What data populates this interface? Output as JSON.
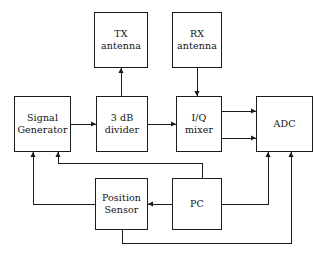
{
  "diagram": {
    "background_color": "#ffffff",
    "stroke_color": "#1a1a1a",
    "text_color": "#111111",
    "nodes": [
      {
        "id": "tx-antenna",
        "name": "tx-antenna-block",
        "line1": "TX",
        "line2": "antenna",
        "x": 94,
        "y": 12,
        "w": 54,
        "h": 56
      },
      {
        "id": "rx-antenna",
        "name": "rx-antenna-block",
        "line1": "RX",
        "line2": "antenna",
        "x": 172,
        "y": 12,
        "w": 50,
        "h": 56
      },
      {
        "id": "signal-generator",
        "name": "signal-generator-block",
        "line1": "Signal",
        "line2": "Generator",
        "x": 14,
        "y": 96,
        "w": 57,
        "h": 56
      },
      {
        "id": "divider",
        "name": "three-db-divider-block",
        "line1": "3 dB",
        "line2": "divider",
        "x": 96,
        "y": 96,
        "w": 52,
        "h": 56
      },
      {
        "id": "iq-mixer",
        "name": "iq-mixer-block",
        "line1": "I/Q",
        "line2": "mixer",
        "x": 176,
        "y": 96,
        "w": 46,
        "h": 56
      },
      {
        "id": "adc",
        "name": "adc-block",
        "line1": "ADC",
        "line2": "",
        "x": 256,
        "y": 96,
        "w": 57,
        "h": 56
      },
      {
        "id": "position-sensor",
        "name": "position-sensor-block",
        "line1": "Position",
        "line2": "Sensor",
        "x": 95,
        "y": 178,
        "w": 53,
        "h": 52
      },
      {
        "id": "pc",
        "name": "pc-block",
        "line1": "PC",
        "line2": "",
        "x": 172,
        "y": 178,
        "w": 50,
        "h": 52
      }
    ],
    "connections": [
      {
        "id": "divider-to-tx",
        "name": "wire-divider-to-tx-antenna",
        "from": "divider",
        "to": "tx-antenna",
        "points": "121,96 121,68",
        "arrow_at": "121,68",
        "arrow_dir": "up"
      },
      {
        "id": "rx-to-mixer",
        "name": "wire-rx-antenna-to-iq-mixer",
        "from": "rx-antenna",
        "to": "iq-mixer",
        "points": "197,68 197,96",
        "arrow_at": "197,96",
        "arrow_dir": "down"
      },
      {
        "id": "siggen-to-divider",
        "name": "wire-signal-generator-to-divider",
        "from": "signal-generator",
        "to": "divider",
        "points": "71,124 96,124",
        "arrow_at": "96,124",
        "arrow_dir": "right"
      },
      {
        "id": "divider-to-mixer",
        "name": "wire-divider-to-iq-mixer",
        "from": "divider",
        "to": "iq-mixer",
        "points": "148,124 176,124",
        "arrow_at": "176,124",
        "arrow_dir": "right"
      },
      {
        "id": "mixer-to-adc-i",
        "name": "wire-iq-mixer-to-adc-channel-i",
        "from": "iq-mixer",
        "to": "adc",
        "points": "222,111 256,111",
        "arrow_at": "256,111",
        "arrow_dir": "right"
      },
      {
        "id": "mixer-to-adc-q",
        "name": "wire-iq-mixer-to-adc-channel-q",
        "from": "iq-mixer",
        "to": "adc",
        "points": "222,138 256,138",
        "arrow_at": "256,138",
        "arrow_dir": "right"
      },
      {
        "id": "pc-to-siggen",
        "name": "wire-pc-to-signal-generator",
        "from": "pc",
        "to": "signal-generator",
        "points": "202,178 202,163 58,163 58,152",
        "arrow_at": "58,152",
        "arrow_dir": "up"
      },
      {
        "id": "pc-to-adc",
        "name": "wire-pc-to-adc",
        "from": "pc",
        "to": "adc",
        "points": "222,204 268,204 268,152",
        "arrow_at": "268,152",
        "arrow_dir": "up"
      },
      {
        "id": "pc-to-position-sensor",
        "name": "wire-pc-to-position-sensor",
        "from": "pc",
        "to": "position-sensor",
        "points": "172,204 148,204",
        "arrow_at": "148,204",
        "arrow_dir": "left"
      },
      {
        "id": "position-sensor-to-siggen",
        "name": "wire-position-sensor-to-signal-generator",
        "from": "position-sensor",
        "to": "signal-generator",
        "points": "95,204 33,204 33,152",
        "arrow_at": "33,152",
        "arrow_dir": "up"
      },
      {
        "id": "position-sensor-to-adc",
        "name": "wire-position-sensor-to-adc",
        "from": "position-sensor",
        "to": "adc",
        "points": "122,230 122,243 291,243 291,152",
        "arrow_at": "291,152",
        "arrow_dir": "up"
      }
    ]
  }
}
